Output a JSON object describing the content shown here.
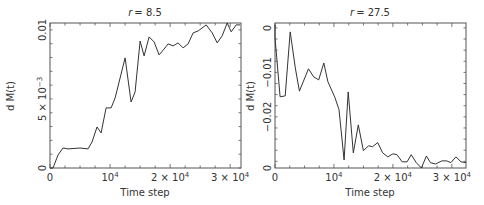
{
  "chart_data": [
    {
      "type": "line",
      "title": "r = 8.5",
      "title_var": "r",
      "title_value": "= 8.5",
      "xlabel": "Time step",
      "ylabel": "d M(t)",
      "xlim": [
        0,
        31800
      ],
      "ylim": [
        0,
        0.0105
      ],
      "x_ticks": [
        {
          "value": 0,
          "label": "0"
        },
        {
          "value": 10000,
          "label": "10",
          "sup": "4"
        },
        {
          "value": 20000,
          "label": "2 × 10",
          "sup": "4"
        },
        {
          "value": 30000,
          "label": "3 × 10",
          "sup": "4"
        }
      ],
      "y_ticks": [
        {
          "value": 0,
          "label": "0"
        },
        {
          "value": 0.005,
          "label": "5 × 10",
          "sup": "−3"
        },
        {
          "value": 0.01,
          "label": "0.01"
        }
      ],
      "grid": false,
      "x": [
        0,
        500,
        1333,
        2167,
        3000,
        5000,
        6333,
        7000,
        7833,
        8500,
        9333,
        10167,
        10833,
        11667,
        12500,
        13500,
        14167,
        15000,
        15667,
        16500,
        17333,
        18167,
        19000,
        19667,
        20500,
        21333,
        22167,
        23000,
        23833,
        24667,
        26000,
        27000,
        27833,
        28667,
        29500,
        30167,
        31000,
        31667
      ],
      "values": [
        0,
        0,
        0.00094,
        0.00145,
        0.00138,
        0.00145,
        0.00138,
        0.00188,
        0.00297,
        0.00254,
        0.00435,
        0.00435,
        0.00507,
        0.00652,
        0.00797,
        0.00478,
        0.00551,
        0.0092,
        0.00812,
        0.00949,
        0.00913,
        0.00819,
        0.00862,
        0.00899,
        0.00884,
        0.00906,
        0.0087,
        0.00899,
        0.00978,
        0.00993,
        0.01036,
        0.00978,
        0.00906,
        0.00957,
        0.01051,
        0.00986,
        0.01036,
        0.01036
      ]
    },
    {
      "type": "line",
      "title": "r = 27.5",
      "title_var": "r",
      "title_value": "= 27.5",
      "xlabel": "Time step",
      "ylabel": "d M(t)",
      "xlim": [
        0,
        32400
      ],
      "ylim": [
        -0.0315,
        0.0011
      ],
      "x_ticks": [
        {
          "value": 0,
          "label": "0"
        },
        {
          "value": 10000,
          "label": "10",
          "sup": "4"
        },
        {
          "value": 20000,
          "label": "2 × 10",
          "sup": "4"
        },
        {
          "value": 30000,
          "label": "3 × 10",
          "sup": "4"
        }
      ],
      "y_ticks": [
        {
          "value": 0,
          "label": "0"
        },
        {
          "value": -0.01,
          "label": "−0.01"
        },
        {
          "value": -0.02,
          "label": "−0.02"
        },
        {
          "value": -0.0315,
          "label": "0"
        }
      ],
      "grid": false,
      "x": [
        0,
        0,
        862,
        1724,
        2586,
        3448,
        4138,
        5690,
        6552,
        7414,
        8276,
        8966,
        10172,
        10862,
        11724,
        12414,
        13276,
        14138,
        15000,
        15862,
        16552,
        17414,
        18276,
        19138,
        20000,
        20690,
        21552,
        22414,
        23103,
        23966,
        24828,
        25690,
        26379,
        27241,
        28276,
        29138,
        29828,
        30690,
        31552,
        32400
      ],
      "values": [
        0.0007,
        -0.0022,
        -0.0155,
        -0.0153,
        -0.0009,
        -0.009,
        -0.0142,
        -0.0092,
        -0.011,
        -0.0117,
        -0.0079,
        -0.0121,
        -0.0157,
        -0.0184,
        -0.0297,
        -0.0144,
        -0.0281,
        -0.0218,
        -0.0276,
        -0.0265,
        -0.0267,
        -0.0258,
        -0.0281,
        -0.029,
        -0.0283,
        -0.0285,
        -0.0301,
        -0.0301,
        -0.0285,
        -0.0303,
        -0.0315,
        -0.0288,
        -0.0303,
        -0.0306,
        -0.0299,
        -0.0299,
        -0.0303,
        -0.029,
        -0.0301,
        -0.0303
      ]
    }
  ]
}
